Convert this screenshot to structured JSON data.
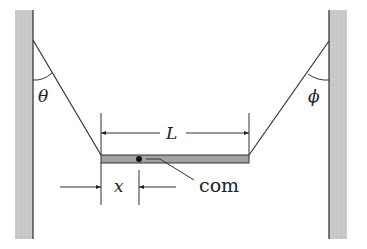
{
  "diagram": {
    "labels": {
      "theta": "θ",
      "phi": "ϕ",
      "length": "L",
      "offset": "x",
      "center_of_mass": "com"
    },
    "colors": {
      "wall_fill": "#c9c9c9",
      "wall_edge": "#3a3a3a",
      "beam_fill": "#a3a3a3",
      "beam_edge": "#333333",
      "line": "#333333",
      "background": "#ffffff"
    },
    "elements": {
      "left_wall": {
        "x": 15,
        "y": 10,
        "width": 18,
        "height": 229
      },
      "right_wall": {
        "x": 329,
        "y": 10,
        "width": 18,
        "height": 229
      },
      "beam": {
        "x": 101,
        "y": 155,
        "width": 148,
        "height": 8
      },
      "left_rope": {
        "from": [
          33,
          40
        ],
        "to": [
          101,
          155
        ]
      },
      "right_rope": {
        "from": [
          329,
          41
        ],
        "to": [
          249,
          155
        ]
      },
      "com_dot": {
        "cx": 139,
        "cy": 159
      }
    }
  }
}
